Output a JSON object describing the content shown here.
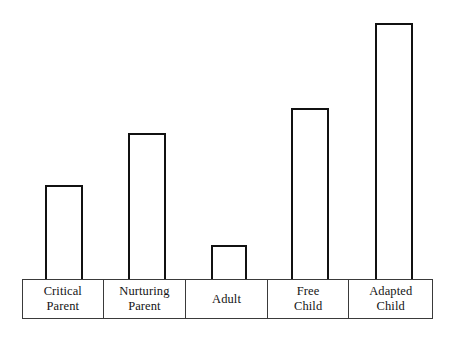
{
  "chart_data": {
    "type": "bar",
    "title": "",
    "subtitle": "",
    "xlabel": "",
    "ylabel": "",
    "grid": false,
    "legend": "none",
    "axis_visible": false,
    "categories": [
      "Critical\nParent",
      "Nurturing\nParent",
      "Adult",
      "Free\nChild",
      "Adapted\nChild"
    ],
    "category_lines": [
      [
        "Critical",
        "Parent"
      ],
      [
        "Nurturing",
        "Parent"
      ],
      [
        "Adult"
      ],
      [
        "Free",
        "Child"
      ],
      [
        "Adapted",
        "Child"
      ]
    ],
    "values": [
      94,
      146,
      34,
      171,
      256
    ],
    "ylim": [
      0,
      270
    ],
    "value_unit": "px-height",
    "bars": [
      {
        "category": "Critical Parent",
        "value": 94,
        "left": 45,
        "top": 185,
        "width": 38,
        "height": 94
      },
      {
        "category": "Nurturing Parent",
        "value": 146,
        "left": 128,
        "top": 133,
        "width": 38,
        "height": 146
      },
      {
        "category": "Adult",
        "value": 34,
        "left": 211,
        "top": 245,
        "width": 36,
        "height": 34
      },
      {
        "category": "Free Child",
        "value": 171,
        "left": 291,
        "top": 108,
        "width": 38,
        "height": 171
      },
      {
        "category": "Adapted Child",
        "value": 256,
        "left": 375,
        "top": 23,
        "width": 38,
        "height": 256
      }
    ],
    "colors": {
      "bar_fill": "#ffffff",
      "bar_stroke": "#111111",
      "table_stroke": "#3a3a3a",
      "background": "#ffffff",
      "text": "#141414"
    },
    "baseline_y": 279
  }
}
